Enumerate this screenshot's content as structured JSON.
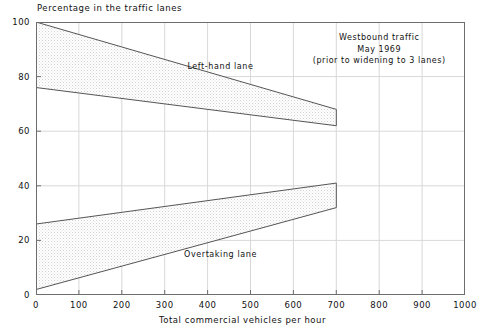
{
  "chart_data": {
    "type": "area",
    "title": "",
    "ylabel": "Percentage in the traffic lanes",
    "xlabel": "Total commercial vehicles per hour",
    "xlim": [
      0,
      1000
    ],
    "ylim": [
      0,
      100
    ],
    "xticks": [
      "0",
      "100",
      "200",
      "300",
      "400",
      "500",
      "600",
      "700",
      "800",
      "900",
      "1000"
    ],
    "yticks": [
      "0",
      "20",
      "40",
      "60",
      "80",
      "100"
    ],
    "grid": true,
    "legend_position": "none",
    "annotations": [
      {
        "name": "left-hand-lane-label",
        "text": "Left-hand lane",
        "x": 430,
        "y": 84
      },
      {
        "name": "overtaking-lane-label",
        "text": "Overtaking lane",
        "x": 430,
        "y": 15
      },
      {
        "name": "note-line-1",
        "text": "Westbound traffic"
      },
      {
        "name": "note-line-2",
        "text": "May 1969"
      },
      {
        "name": "note-line-3",
        "text": "(prior to widening to 3 lanes)"
      }
    ],
    "series": [
      {
        "name": "Left-hand lane upper bound",
        "x": [
          0,
          700
        ],
        "values": [
          100,
          68
        ]
      },
      {
        "name": "Left-hand lane lower bound",
        "x": [
          0,
          700
        ],
        "values": [
          76,
          62
        ]
      },
      {
        "name": "Overtaking lane upper bound",
        "x": [
          0,
          700
        ],
        "values": [
          26,
          41
        ]
      },
      {
        "name": "Overtaking lane lower bound",
        "x": [
          0,
          700
        ],
        "values": [
          2,
          32
        ]
      }
    ],
    "bands": [
      {
        "name": "left-hand-lane-band",
        "upper": "Left-hand lane upper bound",
        "lower": "Left-hand lane lower bound"
      },
      {
        "name": "overtaking-lane-band",
        "upper": "Overtaking lane upper bound",
        "lower": "Overtaking lane lower bound"
      }
    ],
    "colors": {
      "frame": "#6d6d6d",
      "grid": "#d8d8d8",
      "band_edge": "#555555",
      "band_fill": "#ededed",
      "text": "#111111"
    }
  },
  "labels": {
    "y_axis_title": "Percentage in the traffic lanes",
    "x_axis_title": "Total commercial vehicles per hour",
    "left_hand_lane": "Left-hand lane",
    "overtaking_lane": "Overtaking lane",
    "note_1": "Westbound traffic",
    "note_2": "May 1969",
    "note_3": "(prior to widening to 3 lanes)"
  }
}
